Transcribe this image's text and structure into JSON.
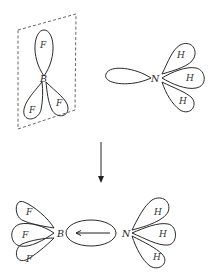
{
  "diagram": {
    "reactants": {
      "bf3": {
        "central_atom": "B",
        "ligands": [
          "F",
          "F",
          "F"
        ],
        "has_plane": true
      },
      "nh3": {
        "central_atom": "N",
        "ligands": [
          "H",
          "H",
          "H"
        ],
        "has_lone_pair": true
      }
    },
    "reaction_arrow": "down",
    "product": {
      "left_atom": "B",
      "left_ligands": [
        "F",
        "F",
        "F"
      ],
      "right_atom": "N",
      "right_ligands": [
        "H",
        "H",
        "H"
      ],
      "bond_type": "dative",
      "bond_arrow_direction": "N-to-B"
    },
    "colors": {
      "stroke": "#2a2a2a",
      "background": "#ffffff"
    }
  }
}
